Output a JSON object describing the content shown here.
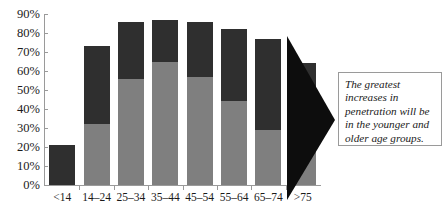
{
  "chart_data": {
    "type": "bar",
    "title": "",
    "subtitle": "",
    "xlabel": "",
    "ylabel": "",
    "stacked": true,
    "grid": false,
    "legend_position": "none",
    "ylim": [
      0,
      90
    ],
    "ytick_labels": [
      "90%",
      "80%",
      "70%",
      "60%",
      "50%",
      "40%",
      "30%",
      "20%",
      "10%",
      "0%"
    ],
    "ytick_values": [
      90,
      80,
      70,
      60,
      50,
      40,
      30,
      20,
      10,
      0
    ],
    "categories": [
      "<14",
      "14–24",
      "25–34",
      "35–44",
      "45–54",
      "55–64",
      "65–74",
      ">75"
    ],
    "series": [
      {
        "name": "Current penetration",
        "color": "#7f7f7f",
        "values": [
          0,
          32,
          56,
          65,
          57,
          44,
          29,
          20
        ]
      },
      {
        "name": "Projected increase",
        "color": "#2f2f2f",
        "values": [
          21,
          41,
          30,
          22,
          29,
          38,
          48,
          44
        ]
      }
    ],
    "totals": [
      21,
      73,
      86,
      87,
      86,
      82,
      77,
      64
    ],
    "annotations": [
      {
        "name": "callout",
        "text": "The greatest increases in penetration will be in the younger and older age groups.",
        "pointer": "arrow-right"
      }
    ]
  },
  "callout": {
    "text": "The greatest increases in penetration will be in the younger and older age groups."
  }
}
